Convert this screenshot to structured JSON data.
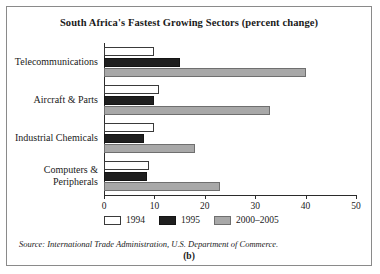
{
  "figure": {
    "title": "South Africa's Fastest Growing Sectors (percent change)",
    "source": "Source: International Trade Administration, U.S. Department of Commerce.",
    "panel_id": "(b)",
    "border_color": "#8a8a8a"
  },
  "chart_data": {
    "type": "bar",
    "orientation": "horizontal",
    "title": "South Africa's Fastest Growing Sectors (percent change)",
    "xlabel": "",
    "ylabel": "",
    "xlim": [
      0,
      50
    ],
    "xticks": [
      0,
      10,
      20,
      30,
      40,
      50
    ],
    "grid": false,
    "legend_position": "bottom-left",
    "categories": [
      "Telecommunications",
      "Aircraft & Parts",
      "Industrial Chemicals",
      "Computers & Peripherals"
    ],
    "series": [
      {
        "name": "1994",
        "color": "#ffffff",
        "values": [
          10,
          11,
          10,
          9
        ]
      },
      {
        "name": "1995",
        "color": "#1f1f1f",
        "values": [
          15,
          10,
          8,
          8.5
        ]
      },
      {
        "name": "2000-2005",
        "color": "#a8a8a8",
        "values": [
          40,
          33,
          18,
          23
        ]
      }
    ]
  }
}
